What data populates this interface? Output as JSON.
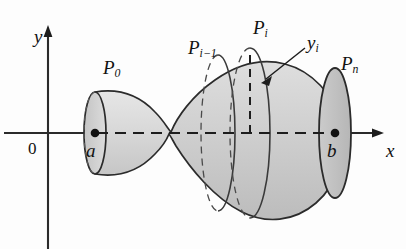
{
  "figure": {
    "type": "math-diagram",
    "background_color": "#fdfdfd",
    "surface_fill_light": "#dcdcdc",
    "surface_fill_mid": "#d0d0d0",
    "surface_fill_dark": "#c3c3c3",
    "stroke_color": "#2b2b2b"
  },
  "axes": {
    "x_label": "x",
    "y_label": "y",
    "origin_label": "0",
    "x_axis_y": 133,
    "y_axis_x": 48
  },
  "points": [
    {
      "name": "point-a",
      "label": "a",
      "x": 95,
      "y": 133,
      "marked": true
    },
    {
      "name": "point-b",
      "label": "b",
      "x": 335,
      "y": 133,
      "marked": true
    }
  ],
  "labels": [
    {
      "name": "label-p0",
      "base": "P",
      "sub": "0",
      "x": 103,
      "y": 58
    },
    {
      "name": "label-pi-1",
      "base": "P",
      "sub": "i−1",
      "x": 188,
      "y": 38
    },
    {
      "name": "label-pi",
      "base": "P",
      "sub": "i",
      "x": 253,
      "y": 18
    },
    {
      "name": "label-yi",
      "base": "y",
      "sub": "i",
      "x": 307,
      "y": 36
    },
    {
      "name": "label-pn",
      "base": "P",
      "sub": "n",
      "x": 341,
      "y": 54
    }
  ],
  "cross_sections": [
    {
      "name": "cross-section-p0",
      "x": 95,
      "ry": 41,
      "rx": 11
    },
    {
      "name": "cross-section-pi-1",
      "x": 218,
      "ry": 78,
      "rx": 17
    },
    {
      "name": "cross-section-pi",
      "x": 250,
      "ry": 85,
      "rx": 20
    },
    {
      "name": "cross-section-pn",
      "x": 335,
      "ry": 65,
      "rx": 16
    }
  ],
  "annotations": {
    "yi_segment": "vertical dashed segment from x-axis to top of solid at P_i",
    "yi_arrow": "arrow pointing from y_i label to the vertical dashed segment"
  }
}
